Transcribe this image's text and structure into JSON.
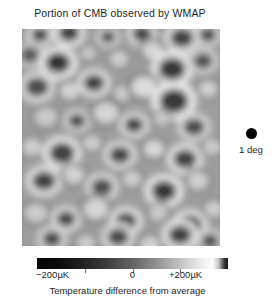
{
  "figure": {
    "title": "Portion of CMB observed by WMAP",
    "background_color": "#ffffff",
    "text_color": "#1f1f1f"
  },
  "map": {
    "name": "cmb-temperature-map",
    "description": "Grayscale CMB temperature anisotropy patch",
    "background_gray": "#8e8e8e",
    "dark_spot_color": "#080808",
    "bright_spot_color": "#f4f4f4"
  },
  "scale_marker": {
    "dot_color": "#000000",
    "label": "1 deg"
  },
  "colorbar": {
    "min_label": "−200µK",
    "mid_label": "0",
    "max_label": "+200µK",
    "caption": "Temperature difference from average",
    "tick_positions_pct": [
      25,
      50,
      75
    ],
    "low_color": "#050505",
    "high_color": "#fbfbfb"
  },
  "chart_data": {
    "type": "heatmap",
    "title": "Portion of CMB observed by WMAP",
    "xlabel": "",
    "ylabel": "",
    "colorbar": {
      "label": "Temperature difference from average",
      "ticks": [
        -200,
        0,
        200
      ],
      "ticklabels": [
        "−200µK",
        "0",
        "+200µK"
      ],
      "unit": "µK",
      "vmin": -200,
      "vmax": 200,
      "cmap": "gray",
      "orientation": "horizontal"
    },
    "annotations": [
      {
        "name": "angular-scale-marker",
        "text": "1 deg",
        "marker": "filled-circle",
        "meaning": "Angular size of one degree on the sky"
      }
    ],
    "grid": false,
    "axes_visible": false,
    "legend_position": "right",
    "blobs": [
      {
        "cx": 18,
        "cy": 6,
        "r": 9,
        "v": -170
      },
      {
        "cx": 47,
        "cy": 4,
        "r": 11,
        "v": -185
      },
      {
        "cx": 86,
        "cy": 8,
        "r": 8,
        "v": -150
      },
      {
        "cx": 120,
        "cy": 5,
        "r": 10,
        "v": -165
      },
      {
        "cx": 160,
        "cy": 9,
        "r": 12,
        "v": -175
      },
      {
        "cx": 186,
        "cy": 6,
        "r": 9,
        "v": -160
      },
      {
        "cx": 8,
        "cy": 26,
        "r": 10,
        "v": -120
      },
      {
        "cx": 36,
        "cy": 34,
        "r": 13,
        "v": -190
      },
      {
        "cx": 66,
        "cy": 24,
        "r": 8,
        "v": 110
      },
      {
        "cx": 97,
        "cy": 30,
        "r": 9,
        "v": 130
      },
      {
        "cx": 131,
        "cy": 22,
        "r": 10,
        "v": 150
      },
      {
        "cx": 150,
        "cy": 40,
        "r": 14,
        "v": -195
      },
      {
        "cx": 181,
        "cy": 32,
        "r": 10,
        "v": -140
      },
      {
        "cx": 15,
        "cy": 58,
        "r": 12,
        "v": -160
      },
      {
        "cx": 48,
        "cy": 62,
        "r": 10,
        "v": 140
      },
      {
        "cx": 72,
        "cy": 54,
        "r": 11,
        "v": -175
      },
      {
        "cx": 101,
        "cy": 64,
        "r": 9,
        "v": 125
      },
      {
        "cx": 122,
        "cy": 58,
        "r": 12,
        "v": 160
      },
      {
        "cx": 152,
        "cy": 72,
        "r": 15,
        "v": -200
      },
      {
        "cx": 186,
        "cy": 60,
        "r": 9,
        "v": 135
      },
      {
        "cx": 24,
        "cy": 88,
        "r": 11,
        "v": 120
      },
      {
        "cx": 55,
        "cy": 92,
        "r": 9,
        "v": -150
      },
      {
        "cx": 84,
        "cy": 84,
        "r": 12,
        "v": 145
      },
      {
        "cx": 112,
        "cy": 96,
        "r": 10,
        "v": -170
      },
      {
        "cx": 140,
        "cy": 90,
        "r": 8,
        "v": 115
      },
      {
        "cx": 172,
        "cy": 98,
        "r": 11,
        "v": -155
      },
      {
        "cx": 10,
        "cy": 118,
        "r": 10,
        "v": 130
      },
      {
        "cx": 40,
        "cy": 124,
        "r": 13,
        "v": -185
      },
      {
        "cx": 70,
        "cy": 114,
        "r": 9,
        "v": 125
      },
      {
        "cx": 98,
        "cy": 126,
        "r": 11,
        "v": -165
      },
      {
        "cx": 132,
        "cy": 120,
        "r": 10,
        "v": 150
      },
      {
        "cx": 163,
        "cy": 130,
        "r": 12,
        "v": -180
      },
      {
        "cx": 190,
        "cy": 118,
        "r": 9,
        "v": 120
      },
      {
        "cx": 22,
        "cy": 152,
        "r": 12,
        "v": -175
      },
      {
        "cx": 52,
        "cy": 146,
        "r": 10,
        "v": 140
      },
      {
        "cx": 80,
        "cy": 158,
        "r": 11,
        "v": -160
      },
      {
        "cx": 110,
        "cy": 150,
        "r": 9,
        "v": 130
      },
      {
        "cx": 142,
        "cy": 162,
        "r": 13,
        "v": -190
      },
      {
        "cx": 176,
        "cy": 152,
        "r": 10,
        "v": 135
      },
      {
        "cx": 14,
        "cy": 184,
        "r": 11,
        "v": 125
      },
      {
        "cx": 44,
        "cy": 190,
        "r": 10,
        "v": -170
      },
      {
        "cx": 74,
        "cy": 180,
        "r": 12,
        "v": 145
      },
      {
        "cx": 104,
        "cy": 192,
        "r": 11,
        "v": -180
      },
      {
        "cx": 136,
        "cy": 184,
        "r": 9,
        "v": 120
      },
      {
        "cx": 168,
        "cy": 196,
        "r": 12,
        "v": -175
      },
      {
        "cx": 192,
        "cy": 180,
        "r": 9,
        "v": 130
      },
      {
        "cx": 30,
        "cy": 210,
        "r": 10,
        "v": -155
      },
      {
        "cx": 64,
        "cy": 214,
        "r": 9,
        "v": 125
      },
      {
        "cx": 96,
        "cy": 208,
        "r": 11,
        "v": -165
      },
      {
        "cx": 128,
        "cy": 216,
        "r": 10,
        "v": 135
      },
      {
        "cx": 158,
        "cy": 206,
        "r": 12,
        "v": -185
      },
      {
        "cx": 188,
        "cy": 212,
        "r": 9,
        "v": -145
      }
    ]
  }
}
